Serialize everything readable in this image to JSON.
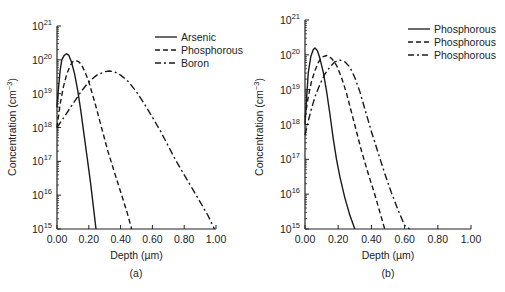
{
  "chart_data": [
    {
      "panel": "(a)",
      "type": "line",
      "title": "",
      "xlabel": "Depth (µm)",
      "ylabel": "Concentration (cm⁻³)",
      "yscale": "log",
      "xlim": [
        0.0,
        1.0
      ],
      "ylim_exp": [
        15,
        21
      ],
      "xticks": [
        "0.00",
        "0.20",
        "0.40",
        "0.60",
        "0.80",
        "1.00"
      ],
      "xtick_values": [
        0,
        0.2,
        0.4,
        0.6,
        0.8,
        1.0
      ],
      "yticks_exp": [
        15,
        16,
        17,
        18,
        19,
        20,
        21
      ],
      "grid": false,
      "legend_position": "upper right",
      "series": [
        {
          "name": "Arsenic",
          "style": "solid",
          "x": [
            0.0,
            0.01,
            0.02,
            0.03,
            0.045,
            0.06,
            0.075,
            0.09,
            0.11,
            0.13,
            0.15,
            0.17,
            0.19,
            0.21,
            0.23,
            0.245
          ],
          "log_y": [
            18.6,
            19.2,
            19.7,
            20.0,
            20.13,
            20.18,
            20.13,
            19.95,
            19.6,
            19.1,
            18.5,
            17.8,
            17.1,
            16.4,
            15.6,
            15.0
          ]
        },
        {
          "name": "Phosphorous",
          "style": "dashed",
          "x": [
            0.0,
            0.02,
            0.04,
            0.06,
            0.08,
            0.1,
            0.12,
            0.14,
            0.16,
            0.18,
            0.2,
            0.24,
            0.28,
            0.32,
            0.36,
            0.4,
            0.44,
            0.47
          ],
          "log_y": [
            18.0,
            18.7,
            19.2,
            19.55,
            19.8,
            19.95,
            19.98,
            19.93,
            19.8,
            19.6,
            19.35,
            18.7,
            18.0,
            17.3,
            16.7,
            16.1,
            15.5,
            15.0
          ]
        },
        {
          "name": "Boron",
          "style": "dashdot",
          "x": [
            0.0,
            0.05,
            0.1,
            0.15,
            0.2,
            0.25,
            0.3,
            0.33,
            0.36,
            0.4,
            0.45,
            0.5,
            0.55,
            0.6,
            0.65,
            0.7,
            0.75,
            0.8,
            0.85,
            0.9,
            0.95,
            0.99
          ],
          "log_y": [
            18.0,
            18.35,
            18.7,
            19.05,
            19.35,
            19.55,
            19.65,
            19.67,
            19.65,
            19.55,
            19.35,
            19.05,
            18.7,
            18.3,
            17.9,
            17.45,
            17.0,
            16.6,
            16.2,
            15.8,
            15.4,
            15.0
          ]
        }
      ],
      "caption": "(a)"
    },
    {
      "panel": "(b)",
      "type": "line",
      "title": "",
      "xlabel": "Depth (µm)",
      "ylabel": "Concentration (cm⁻³)",
      "yscale": "log",
      "xlim": [
        0.0,
        1.0
      ],
      "ylim_exp": [
        15,
        21
      ],
      "xticks": [
        "0.00",
        "0.20",
        "0.40",
        "0.60",
        "0.80",
        "1.00"
      ],
      "xtick_values": [
        0,
        0.2,
        0.4,
        0.6,
        0.8,
        1.0
      ],
      "yticks_exp": [
        15,
        16,
        17,
        18,
        19,
        20,
        21
      ],
      "grid": false,
      "legend_position": "upper right",
      "series": [
        {
          "name": "Phosphorous",
          "style": "solid",
          "x": [
            0.0,
            0.01,
            0.02,
            0.035,
            0.05,
            0.06,
            0.075,
            0.09,
            0.11,
            0.13,
            0.15,
            0.17,
            0.19,
            0.21,
            0.24,
            0.27,
            0.3
          ],
          "log_y": [
            18.0,
            18.8,
            19.5,
            19.95,
            20.15,
            20.2,
            20.12,
            19.9,
            19.5,
            18.95,
            18.3,
            17.6,
            17.0,
            16.5,
            15.9,
            15.4,
            15.0
          ]
        },
        {
          "name": "Phosphorous",
          "style": "dashed",
          "x": [
            0.0,
            0.02,
            0.04,
            0.06,
            0.08,
            0.1,
            0.13,
            0.16,
            0.19,
            0.22,
            0.25,
            0.28,
            0.31,
            0.34,
            0.38,
            0.42,
            0.45,
            0.48
          ],
          "log_y": [
            18.2,
            18.8,
            19.25,
            19.55,
            19.78,
            19.93,
            19.98,
            19.9,
            19.7,
            19.35,
            18.9,
            18.35,
            17.8,
            17.25,
            16.6,
            16.0,
            15.5,
            15.0
          ]
        },
        {
          "name": "Phosphorous",
          "style": "dashdot",
          "x": [
            0.0,
            0.03,
            0.06,
            0.09,
            0.12,
            0.15,
            0.18,
            0.21,
            0.24,
            0.27,
            0.3,
            0.33,
            0.36,
            0.4,
            0.44,
            0.48,
            0.52,
            0.56,
            0.6,
            0.63
          ],
          "log_y": [
            17.7,
            18.3,
            18.8,
            19.15,
            19.45,
            19.65,
            19.8,
            19.85,
            19.8,
            19.65,
            19.35,
            18.95,
            18.45,
            17.8,
            17.2,
            16.6,
            16.05,
            15.55,
            15.1,
            15.0
          ]
        }
      ],
      "caption": "(b)"
    }
  ],
  "labels": {
    "ylabel_text": "Concentration (cm",
    "ylabel_sup": "−3",
    "ylabel_close": ")",
    "xlabel": "Depth (µm)",
    "base": "10"
  }
}
